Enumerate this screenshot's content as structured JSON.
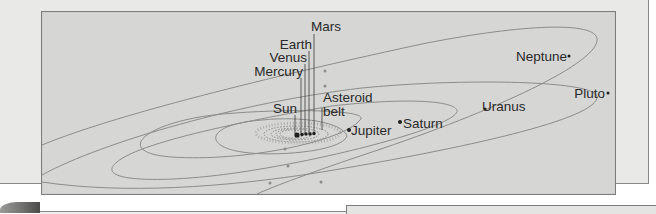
{
  "figure": {
    "labels": {
      "mars": "Mars",
      "earth": "Earth",
      "venus": "Venus",
      "mercury": "Mercury",
      "sun": "Sun",
      "asteroid_belt_line1": "Asteroid",
      "asteroid_belt_line2": "belt",
      "jupiter": "Jupiter",
      "saturn": "Saturn",
      "uranus": "Uranus",
      "neptune": "Neptune",
      "pluto": "Pluto"
    },
    "bodies": [
      "Sun",
      "Mercury",
      "Venus",
      "Earth",
      "Mars",
      "Asteroid belt",
      "Jupiter",
      "Saturn",
      "Uranus",
      "Neptune",
      "Pluto"
    ],
    "colors": {
      "page_background": "#e9e9e8",
      "diagram_background": "#d6d6d4",
      "orbit_line": "#8c8c8a",
      "text": "#2a2a2a",
      "planet_dot": "#1e1e1e"
    }
  }
}
